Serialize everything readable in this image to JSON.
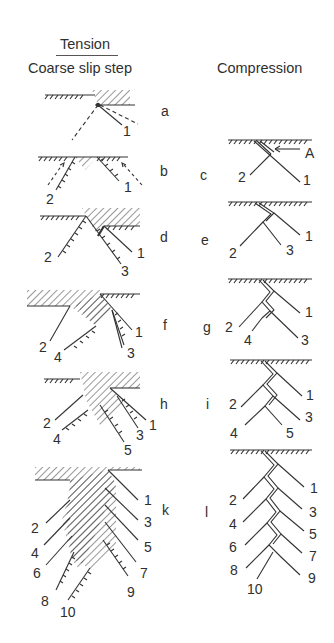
{
  "headers": {
    "tension_title": "Tension",
    "tension_subtitle": "Coarse slip step",
    "compression_title": "Compression"
  },
  "tension_panels": [
    {
      "letter": "a",
      "labels": [
        "1"
      ]
    },
    {
      "letter": "b",
      "labels": [
        "2",
        "1"
      ]
    },
    {
      "letter": "d",
      "labels": [
        "2",
        "1",
        "3"
      ]
    },
    {
      "letter": "f",
      "labels": [
        "2",
        "4",
        "1",
        "3"
      ]
    },
    {
      "letter": "h",
      "labels": [
        "2",
        "4",
        "1",
        "3",
        "5"
      ]
    },
    {
      "letter": "k",
      "labels": [
        "2",
        "4",
        "6",
        "8",
        "10",
        "1",
        "3",
        "5",
        "7",
        "9"
      ]
    }
  ],
  "compression_panels": [
    {
      "letter": "c",
      "labels": [
        "2",
        "1"
      ],
      "annotation": "A"
    },
    {
      "letter": "e",
      "labels": [
        "2",
        "1",
        "3"
      ]
    },
    {
      "letter": "g",
      "labels": [
        "2",
        "4",
        "1",
        "3"
      ]
    },
    {
      "letter": "i",
      "labels": [
        "2",
        "4",
        "1",
        "3",
        "5"
      ]
    },
    {
      "letter": "l",
      "labels": [
        "2",
        "4",
        "6",
        "8",
        "10",
        "1",
        "3",
        "5",
        "7",
        "9"
      ]
    }
  ]
}
